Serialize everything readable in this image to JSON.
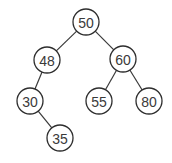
{
  "diagram": {
    "type": "binary-search-tree",
    "node_radius": 13,
    "colors": {
      "background": "#ffffff",
      "stroke": "#2e2e2e",
      "text": "#3a3a3a"
    },
    "nodes": [
      {
        "id": "n50",
        "label": "50",
        "cx": 86,
        "cy": 22
      },
      {
        "id": "n48",
        "label": "48",
        "cx": 47,
        "cy": 60
      },
      {
        "id": "n60",
        "label": "60",
        "cx": 123,
        "cy": 59
      },
      {
        "id": "n30",
        "label": "30",
        "cx": 30,
        "cy": 101
      },
      {
        "id": "n55",
        "label": "55",
        "cx": 99,
        "cy": 101
      },
      {
        "id": "n80",
        "label": "80",
        "cx": 149,
        "cy": 101
      },
      {
        "id": "n35",
        "label": "35",
        "cx": 60,
        "cy": 138
      }
    ],
    "edges": [
      {
        "from": "n50",
        "to": "n48"
      },
      {
        "from": "n50",
        "to": "n60"
      },
      {
        "from": "n48",
        "to": "n30"
      },
      {
        "from": "n60",
        "to": "n55"
      },
      {
        "from": "n60",
        "to": "n80"
      },
      {
        "from": "n30",
        "to": "n35"
      }
    ]
  }
}
